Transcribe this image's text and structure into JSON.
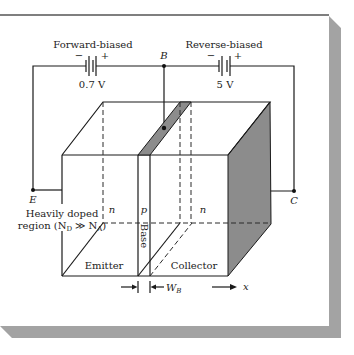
{
  "colors": {
    "ink": "#1a1a1a",
    "shade": "#8c8c8c",
    "card_shadow": "#a3a3a3",
    "card_border": "#555555",
    "card_bg": "#ffffff"
  },
  "circuit": {
    "forward_label": "Forward-biased",
    "forward_voltage": "0.7 V",
    "reverse_label": "Reverse-biased",
    "reverse_voltage": "5 V",
    "minus": "−",
    "plus": "+",
    "base_terminal": "B",
    "emitter_terminal": "E",
    "collector_terminal": "C"
  },
  "device": {
    "heavily_doped_line1": "Heavily doped",
    "region_prefix": "region (N",
    "nd_sub": "D",
    "region_mid": " ≫ N",
    "na_sub": "A",
    "region_suffix": ")",
    "emitter_type": "n",
    "base_type": "p",
    "collector_type": "n",
    "base_region": "Base",
    "emitter_region": "Emitter",
    "collector_region": "Collector",
    "width_symbol": "W",
    "width_sub": "B",
    "axis_label": "x"
  }
}
